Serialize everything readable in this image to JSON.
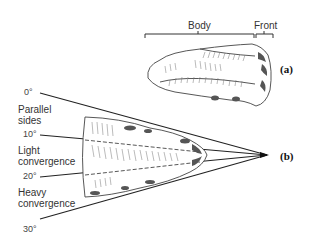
{
  "figure_a": {
    "tag": "(a)",
    "brackets": {
      "body": "Body",
      "front": "Front"
    }
  },
  "figure_b": {
    "tag": "(b)",
    "angles": [
      "0°",
      "10°",
      "20°",
      "30°"
    ],
    "zones": [
      {
        "line1": "Parallel",
        "line2": "sides"
      },
      {
        "line1": "Light",
        "line2": "convergence"
      },
      {
        "line1": "Heavy",
        "line2": "convergence"
      }
    ]
  }
}
